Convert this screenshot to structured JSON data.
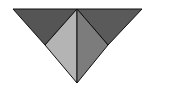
{
  "diagram": {
    "type": "tangram-triangle",
    "vertices": {
      "top_left": [
        13,
        9
      ],
      "top_center": [
        77,
        9
      ],
      "top_right": [
        142,
        9
      ],
      "inner_left": [
        45,
        45
      ],
      "inner_right": [
        108,
        45
      ],
      "bottom": [
        77,
        83
      ]
    },
    "pieces": [
      {
        "name": "top-left-triangle",
        "fill": "#555555"
      },
      {
        "name": "top-right-triangle",
        "fill": "#5a5a5a"
      },
      {
        "name": "center-left-triangle",
        "fill": "#b4b4b4"
      },
      {
        "name": "center-right-triangle",
        "fill": "#7c7c7c"
      }
    ],
    "stroke": "#111111"
  }
}
